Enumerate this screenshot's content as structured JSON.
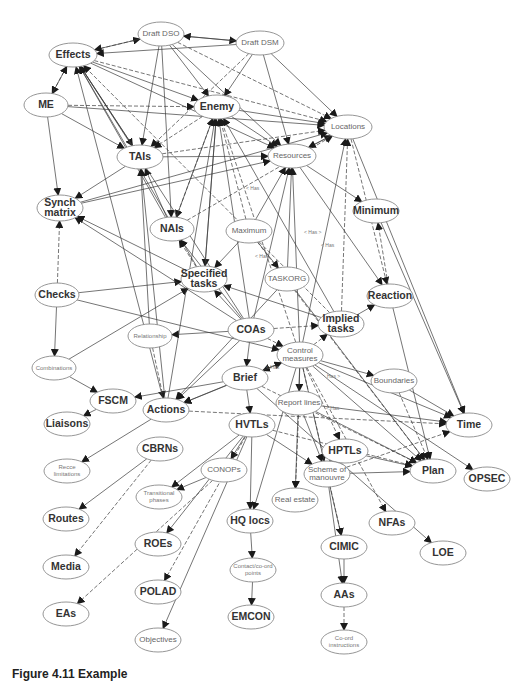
{
  "figure": {
    "caption": "Figure 4.11 Example"
  },
  "diagram": {
    "nodes": [
      {
        "id": "draft-dso",
        "label": "Draft DSO",
        "x": 161,
        "y": 34,
        "rx": 23,
        "ry": 12,
        "style": "minor"
      },
      {
        "id": "draft-dsm",
        "label": "Draft DSM",
        "x": 260,
        "y": 43,
        "rx": 24,
        "ry": 12,
        "style": "minor"
      },
      {
        "id": "effects",
        "label": "Effects",
        "x": 73,
        "y": 55,
        "rx": 24,
        "ry": 12,
        "style": "major"
      },
      {
        "id": "me",
        "label": "ME",
        "x": 46,
        "y": 105,
        "rx": 22,
        "ry": 12,
        "style": "major"
      },
      {
        "id": "enemy",
        "label": "Enemy",
        "x": 217,
        "y": 107,
        "rx": 23,
        "ry": 12,
        "style": "major"
      },
      {
        "id": "locations",
        "label": "Locations",
        "x": 348,
        "y": 127,
        "rx": 24,
        "ry": 12,
        "style": "minor"
      },
      {
        "id": "tais",
        "label": "TAIs",
        "x": 140,
        "y": 157,
        "rx": 23,
        "ry": 12,
        "style": "major"
      },
      {
        "id": "resources",
        "label": "Resources",
        "x": 292,
        "y": 156,
        "rx": 24,
        "ry": 12,
        "style": "minor"
      },
      {
        "id": "synch-matrix",
        "label": "Synch\nmatrix",
        "x": 60,
        "y": 208,
        "rx": 23,
        "ry": 13,
        "style": "major"
      },
      {
        "id": "minimum",
        "label": "Minimum",
        "x": 376,
        "y": 211,
        "rx": 23,
        "ry": 12,
        "style": "major"
      },
      {
        "id": "nais",
        "label": "NAIs",
        "x": 172,
        "y": 229,
        "rx": 22,
        "ry": 12,
        "style": "major"
      },
      {
        "id": "maximum",
        "label": "Maximum",
        "x": 249,
        "y": 231,
        "rx": 23,
        "ry": 12,
        "style": "minor"
      },
      {
        "id": "specified-tasks",
        "label": "Specified\ntasks",
        "x": 204,
        "y": 279,
        "rx": 23,
        "ry": 13,
        "style": "major"
      },
      {
        "id": "checks",
        "label": "Checks",
        "x": 57,
        "y": 295,
        "rx": 22,
        "ry": 12,
        "style": "major"
      },
      {
        "id": "taskorg",
        "label": "TASKORG",
        "x": 287,
        "y": 279,
        "rx": 22,
        "ry": 12,
        "style": "minor"
      },
      {
        "id": "reaction",
        "label": "Reaction",
        "x": 390,
        "y": 296,
        "rx": 23,
        "ry": 12,
        "style": "major"
      },
      {
        "id": "implied-tasks",
        "label": "Implied\ntasks",
        "x": 341,
        "y": 324,
        "rx": 23,
        "ry": 13,
        "style": "major"
      },
      {
        "id": "relationship",
        "label": "Relationship",
        "x": 150,
        "y": 336,
        "rx": 22,
        "ry": 12,
        "style": "tiny"
      },
      {
        "id": "coas",
        "label": "COAs",
        "x": 251,
        "y": 330,
        "rx": 23,
        "ry": 12,
        "style": "major"
      },
      {
        "id": "combinations",
        "label": "Combinations",
        "x": 54,
        "y": 368,
        "rx": 22,
        "ry": 12,
        "style": "tiny"
      },
      {
        "id": "control-measures",
        "label": "Control\nmeasures",
        "x": 300,
        "y": 355,
        "rx": 23,
        "ry": 13,
        "style": "minor"
      },
      {
        "id": "brief",
        "label": "Brief",
        "x": 245,
        "y": 378,
        "rx": 23,
        "ry": 12,
        "style": "major"
      },
      {
        "id": "boundaries",
        "label": "Boundaries",
        "x": 394,
        "y": 381,
        "rx": 23,
        "ry": 12,
        "style": "minor"
      },
      {
        "id": "fscm",
        "label": "FSCM",
        "x": 113,
        "y": 401,
        "rx": 23,
        "ry": 12,
        "style": "major"
      },
      {
        "id": "actions",
        "label": "Actions",
        "x": 166,
        "y": 410,
        "rx": 23,
        "ry": 12,
        "style": "major"
      },
      {
        "id": "report-lines",
        "label": "Report lines",
        "x": 299,
        "y": 403,
        "rx": 23,
        "ry": 12,
        "style": "minor"
      },
      {
        "id": "liaisons",
        "label": "Liaisons",
        "x": 67,
        "y": 424,
        "rx": 23,
        "ry": 12,
        "style": "major"
      },
      {
        "id": "hvtls",
        "label": "HVTLs",
        "x": 252,
        "y": 425,
        "rx": 23,
        "ry": 12,
        "style": "major"
      },
      {
        "id": "time",
        "label": "Time",
        "x": 469,
        "y": 425,
        "rx": 23,
        "ry": 12,
        "style": "major"
      },
      {
        "id": "cbrns",
        "label": "CBRNs",
        "x": 160,
        "y": 449,
        "rx": 23,
        "ry": 12,
        "style": "major"
      },
      {
        "id": "hptls",
        "label": "HPTLs",
        "x": 345,
        "y": 451,
        "rx": 23,
        "ry": 12,
        "style": "major"
      },
      {
        "id": "recce-limitations",
        "label": "Recce\nlimitations",
        "x": 67,
        "y": 471,
        "rx": 23,
        "ry": 12,
        "style": "tiny"
      },
      {
        "id": "conops",
        "label": "CONOPs",
        "x": 224,
        "y": 470,
        "rx": 23,
        "ry": 12,
        "style": "minor"
      },
      {
        "id": "scheme-of-manouvre",
        "label": "Scheme of\nmanouvre",
        "x": 327,
        "y": 474,
        "rx": 23,
        "ry": 13,
        "style": "minor"
      },
      {
        "id": "plan",
        "label": "Plan",
        "x": 433,
        "y": 471,
        "rx": 23,
        "ry": 12,
        "style": "major"
      },
      {
        "id": "opsec",
        "label": "OPSEC",
        "x": 487,
        "y": 479,
        "rx": 23,
        "ry": 12,
        "style": "major"
      },
      {
        "id": "transitional-phases",
        "label": "Transitional\nphases",
        "x": 159,
        "y": 497,
        "rx": 23,
        "ry": 12,
        "style": "tiny"
      },
      {
        "id": "real-estate",
        "label": "Real estate",
        "x": 295,
        "y": 500,
        "rx": 23,
        "ry": 12,
        "style": "minor"
      },
      {
        "id": "routes",
        "label": "Routes",
        "x": 66,
        "y": 519,
        "rx": 23,
        "ry": 12,
        "style": "major"
      },
      {
        "id": "nfas",
        "label": "NFAs",
        "x": 392,
        "y": 523,
        "rx": 23,
        "ry": 12,
        "style": "major"
      },
      {
        "id": "hq-locs",
        "label": "HQ locs",
        "x": 250,
        "y": 521,
        "rx": 23,
        "ry": 12,
        "style": "major"
      },
      {
        "id": "roes",
        "label": "ROEs",
        "x": 158,
        "y": 544,
        "rx": 23,
        "ry": 12,
        "style": "major"
      },
      {
        "id": "cimic",
        "label": "CIMIC",
        "x": 344,
        "y": 547,
        "rx": 23,
        "ry": 12,
        "style": "major"
      },
      {
        "id": "loe",
        "label": "LOE",
        "x": 443,
        "y": 553,
        "rx": 23,
        "ry": 12,
        "style": "major"
      },
      {
        "id": "media",
        "label": "Media",
        "x": 66,
        "y": 567,
        "rx": 23,
        "ry": 12,
        "style": "major"
      },
      {
        "id": "contact-points",
        "label": "Contact/co-ord\npoints",
        "x": 253,
        "y": 570,
        "rx": 23,
        "ry": 12,
        "style": "tiny"
      },
      {
        "id": "polad",
        "label": "POLAD",
        "x": 158,
        "y": 592,
        "rx": 23,
        "ry": 12,
        "style": "major"
      },
      {
        "id": "aas",
        "label": "AAs",
        "x": 344,
        "y": 595,
        "rx": 23,
        "ry": 12,
        "style": "major"
      },
      {
        "id": "eas",
        "label": "EAs",
        "x": 66,
        "y": 614,
        "rx": 23,
        "ry": 12,
        "style": "major"
      },
      {
        "id": "emcon",
        "label": "EMCON",
        "x": 251,
        "y": 617,
        "rx": 23,
        "ry": 12,
        "style": "major"
      },
      {
        "id": "objectives",
        "label": "Objectives",
        "x": 158,
        "y": 640,
        "rx": 23,
        "ry": 12,
        "style": "minor"
      },
      {
        "id": "coord-instructions",
        "label": "Co-ord\ninstructions",
        "x": 344,
        "y": 642,
        "rx": 23,
        "ry": 12,
        "style": "tiny"
      }
    ],
    "edges": [
      [
        "effects",
        "draft-dso"
      ],
      [
        "draft-dso",
        "effects"
      ],
      [
        "draft-dso",
        "draft-dsm"
      ],
      [
        "draft-dsm",
        "draft-dso"
      ],
      [
        "effects",
        "me"
      ],
      [
        "me",
        "effects"
      ],
      [
        "effects",
        "enemy"
      ],
      [
        "effects",
        "tais"
      ],
      [
        "effects",
        "locations"
      ],
      [
        "effects",
        "resources"
      ],
      [
        "draft-dso",
        "enemy"
      ],
      [
        "draft-dso",
        "tais"
      ],
      [
        "draft-dso",
        "locations"
      ],
      [
        "draft-dso",
        "resources"
      ],
      [
        "draft-dso",
        "nais"
      ],
      [
        "draft-dsm",
        "enemy"
      ],
      [
        "draft-dsm",
        "tais"
      ],
      [
        "draft-dsm",
        "locations"
      ],
      [
        "draft-dsm",
        "effects"
      ],
      [
        "draft-dsm",
        "resources"
      ],
      [
        "me",
        "enemy"
      ],
      [
        "me",
        "synch-matrix"
      ],
      [
        "me",
        "tais"
      ],
      [
        "me",
        "locations"
      ],
      [
        "enemy",
        "tais"
      ],
      [
        "enemy",
        "locations"
      ],
      [
        "enemy",
        "resources"
      ],
      [
        "enemy",
        "specified-tasks"
      ],
      [
        "enemy",
        "nais"
      ],
      [
        "tais",
        "effects"
      ],
      [
        "tais",
        "synch-matrix"
      ],
      [
        "tais",
        "resources"
      ],
      [
        "tais",
        "locations"
      ],
      [
        "nais",
        "effects"
      ],
      [
        "nais",
        "tais"
      ],
      [
        "nais",
        "enemy"
      ],
      [
        "nais",
        "locations"
      ],
      [
        "resources",
        "minimum"
      ],
      [
        "resources",
        "reaction"
      ],
      [
        "resources",
        "locations"
      ],
      [
        "locations",
        "reaction"
      ],
      [
        "locations",
        "time"
      ],
      [
        "locations",
        "resources"
      ],
      [
        "minimum",
        "time"
      ],
      [
        "reaction",
        "minimum"
      ],
      [
        "reaction",
        "plan"
      ],
      [
        "synch-matrix",
        "locations"
      ],
      [
        "synch-matrix",
        "resources"
      ],
      [
        "checks",
        "synch-matrix"
      ],
      [
        "checks",
        "specified-tasks"
      ],
      [
        "checks",
        "control-measures"
      ],
      [
        "checks",
        "combinations"
      ],
      [
        "specified-tasks",
        "nais"
      ],
      [
        "specified-tasks",
        "effects"
      ],
      [
        "specified-tasks",
        "enemy"
      ],
      [
        "specified-tasks",
        "synch-matrix"
      ],
      [
        "maximum",
        "enemy"
      ],
      [
        "maximum",
        "resources"
      ],
      [
        "maximum",
        "specified-tasks"
      ],
      [
        "maximum",
        "taskorg"
      ],
      [
        "maximum",
        "plan"
      ],
      [
        "taskorg",
        "resources"
      ],
      [
        "taskorg",
        "actions"
      ],
      [
        "taskorg",
        "plan"
      ],
      [
        "implied-tasks",
        "effects"
      ],
      [
        "implied-tasks",
        "enemy"
      ],
      [
        "implied-tasks",
        "reaction"
      ],
      [
        "implied-tasks",
        "specified-tasks"
      ],
      [
        "implied-tasks",
        "locations"
      ],
      [
        "coas",
        "effects"
      ],
      [
        "coas",
        "enemy"
      ],
      [
        "coas",
        "specified-tasks"
      ],
      [
        "coas",
        "implied-tasks"
      ],
      [
        "coas",
        "relationship"
      ],
      [
        "coas",
        "actions"
      ],
      [
        "coas",
        "brief"
      ],
      [
        "coas",
        "control-measures"
      ],
      [
        "coas",
        "resources"
      ],
      [
        "coas",
        "nais"
      ],
      [
        "coas",
        "synch-matrix"
      ],
      [
        "relationship",
        "actions"
      ],
      [
        "relationship",
        "tais"
      ],
      [
        "combinations",
        "fscm"
      ],
      [
        "combinations",
        "specified-tasks"
      ],
      [
        "control-measures",
        "implied-tasks"
      ],
      [
        "control-measures",
        "locations"
      ],
      [
        "control-measures",
        "boundaries"
      ],
      [
        "control-measures",
        "report-lines"
      ],
      [
        "control-measures",
        "hptls"
      ],
      [
        "control-measures",
        "plan"
      ],
      [
        "control-measures",
        "time"
      ],
      [
        "control-measures",
        "opsec"
      ],
      [
        "control-measures",
        "nfas"
      ],
      [
        "control-measures",
        "scheme-of-manouvre"
      ],
      [
        "control-measures",
        "hq-locs"
      ],
      [
        "control-measures",
        "real-estate"
      ],
      [
        "control-measures",
        "cimic"
      ],
      [
        "control-measures",
        "actions"
      ],
      [
        "control-measures",
        "brief"
      ],
      [
        "control-measures",
        "resources"
      ],
      [
        "control-measures",
        "enemy"
      ],
      [
        "brief",
        "actions"
      ],
      [
        "brief",
        "fscm"
      ],
      [
        "brief",
        "control-measures"
      ],
      [
        "brief",
        "plan"
      ],
      [
        "brief",
        "hvtls"
      ],
      [
        "brief",
        "loe"
      ],
      [
        "boundaries",
        "time"
      ],
      [
        "boundaries",
        "plan"
      ],
      [
        "fscm",
        "liaisons"
      ],
      [
        "actions",
        "recce-limitations"
      ],
      [
        "actions",
        "effects"
      ],
      [
        "actions",
        "time"
      ],
      [
        "actions",
        "enemy"
      ],
      [
        "actions",
        "tais"
      ],
      [
        "report-lines",
        "time"
      ],
      [
        "report-lines",
        "real-estate"
      ],
      [
        "report-lines",
        "scheme-of-manouvre"
      ],
      [
        "report-lines",
        "plan"
      ],
      [
        "hvtls",
        "conops"
      ],
      [
        "hvtls",
        "plan"
      ],
      [
        "hvtls",
        "hq-locs"
      ],
      [
        "hvtls",
        "transitional-phases"
      ],
      [
        "hvtls",
        "roes"
      ],
      [
        "hvtls",
        "polad"
      ],
      [
        "hvtls",
        "objectives"
      ],
      [
        "hvtls",
        "scheme-of-manouvre"
      ],
      [
        "cbrns",
        "routes"
      ],
      [
        "cbrns",
        "media"
      ],
      [
        "hptls",
        "plan"
      ],
      [
        "hptls",
        "scheme-of-manouvre"
      ],
      [
        "scheme-of-manouvre",
        "plan"
      ],
      [
        "scheme-of-manouvre",
        "time"
      ],
      [
        "scheme-of-manouvre",
        "cimic"
      ],
      [
        "scheme-of-manouvre",
        "aas"
      ],
      [
        "conops",
        "transitional-phases"
      ],
      [
        "conops",
        "eas"
      ],
      [
        "hq-locs",
        "contact-points"
      ],
      [
        "contact-points",
        "emcon"
      ],
      [
        "cimic",
        "aas"
      ],
      [
        "aas",
        "coord-instructions"
      ]
    ],
    "edge_labels": [
      {
        "text": "< Has >",
        "x": 304,
        "y": 234
      },
      {
        "text": "< Has",
        "x": 321,
        "y": 247
      },
      {
        "text": "< Has",
        "x": 255,
        "y": 258
      },
      {
        "text": "< Has",
        "x": 246,
        "y": 190
      },
      {
        "text": "< Has",
        "x": 326,
        "y": 410
      },
      {
        "text": "Has >",
        "x": 327,
        "y": 378
      },
      {
        "text": "< Has",
        "x": 266,
        "y": 369
      }
    ]
  }
}
